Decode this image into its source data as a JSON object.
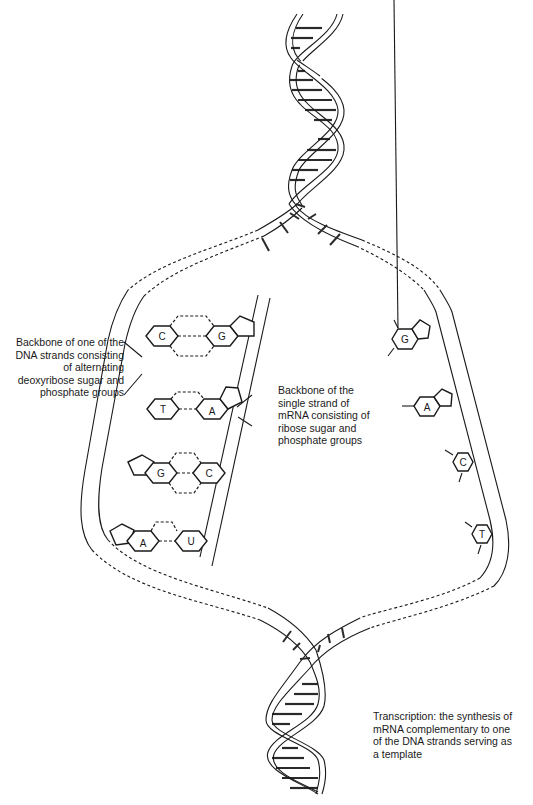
{
  "diagram": {
    "labels": {
      "dna_backbone": "Backbone of one of the\nDNA strands consisting\nof alternating\ndeoxyribose sugar and\nphosphate groups",
      "mrna_backbone": "Backbone of the\nsingle strand of\nmRNA consisting of\nribose sugar and\nphosphate groups",
      "caption": "Transcription: the synthesis of\nmRNA complementary to one\nof the DNA strands serving as\na template"
    },
    "base_pairs": [
      {
        "dna_base": "C",
        "rna_base": "G"
      },
      {
        "dna_base": "T",
        "rna_base": "A"
      },
      {
        "dna_base": "G",
        "rna_base": "C"
      },
      {
        "dna_base": "A",
        "rna_base": "U"
      }
    ],
    "free_strand_bases": [
      "G",
      "A",
      "C",
      "T"
    ],
    "colors": {
      "line": "#1a1a1a",
      "background": "#ffffff"
    }
  }
}
